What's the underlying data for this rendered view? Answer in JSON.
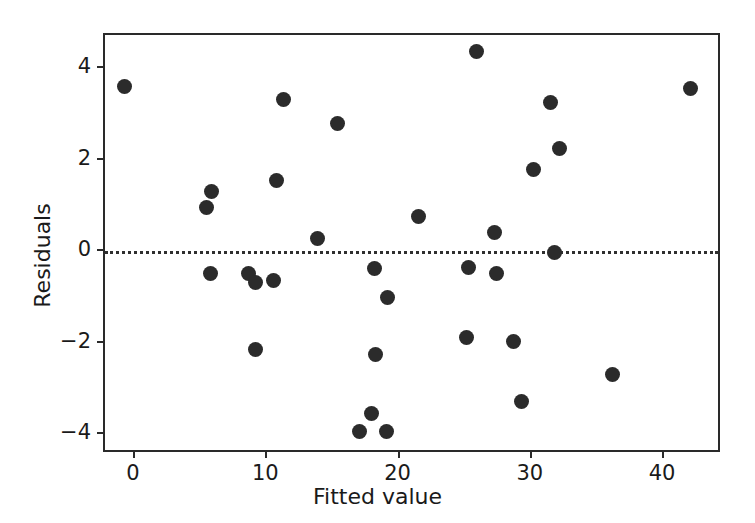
{
  "chart_data": {
    "type": "scatter",
    "title": "",
    "xlabel": "Fitted value",
    "ylabel": "Residuals",
    "xlim": [
      -2.27,
      44.4
    ],
    "ylim": [
      -4.72,
      4.79
    ],
    "xticks": [
      0,
      10,
      20,
      30,
      40
    ],
    "xticklabels": [
      "0",
      "10",
      "20",
      "30",
      "40"
    ],
    "yticks": [
      -4,
      -2,
      0,
      2,
      4
    ],
    "yticklabels": [
      "−4",
      "−2",
      "0",
      "2",
      "4"
    ],
    "grid": false,
    "legend": null,
    "marker": {
      "shape": "circle",
      "color": "#2b2b2b",
      "size_px": 15
    },
    "reference_line": {
      "orientation": "horizontal",
      "y": 0,
      "style": "dotted",
      "color": "#2f2f2f"
    },
    "series": [
      {
        "name": "residuals",
        "points": [
          {
            "x": -0.8,
            "y": 3.6
          },
          {
            "x": 5.4,
            "y": 0.95
          },
          {
            "x": 5.8,
            "y": 1.3
          },
          {
            "x": 5.7,
            "y": -0.5
          },
          {
            "x": 8.6,
            "y": -0.5
          },
          {
            "x": 9.1,
            "y": -0.68
          },
          {
            "x": 9.1,
            "y": -2.15
          },
          {
            "x": 10.5,
            "y": -0.65
          },
          {
            "x": 10.7,
            "y": 1.55
          },
          {
            "x": 11.2,
            "y": 3.32
          },
          {
            "x": 13.8,
            "y": 0.27
          },
          {
            "x": 15.3,
            "y": 2.78
          },
          {
            "x": 17.0,
            "y": -3.95
          },
          {
            "x": 17.9,
            "y": -3.55
          },
          {
            "x": 18.1,
            "y": -0.38
          },
          {
            "x": 18.2,
            "y": -2.27
          },
          {
            "x": 19.0,
            "y": -3.95
          },
          {
            "x": 19.1,
            "y": -1.02
          },
          {
            "x": 21.4,
            "y": 0.75
          },
          {
            "x": 25.1,
            "y": -1.9
          },
          {
            "x": 25.2,
            "y": -0.36
          },
          {
            "x": 25.8,
            "y": 4.37
          },
          {
            "x": 27.2,
            "y": 0.4
          },
          {
            "x": 27.3,
            "y": -0.5
          },
          {
            "x": 28.6,
            "y": -1.98
          },
          {
            "x": 29.2,
            "y": -3.3
          },
          {
            "x": 30.1,
            "y": 1.79
          },
          {
            "x": 31.4,
            "y": 3.24
          },
          {
            "x": 31.7,
            "y": -0.03
          },
          {
            "x": 32.1,
            "y": 2.24
          },
          {
            "x": 36.1,
            "y": -2.7
          },
          {
            "x": 42.0,
            "y": 3.56
          }
        ]
      }
    ]
  }
}
